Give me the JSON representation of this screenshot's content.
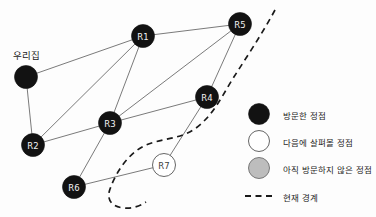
{
  "diagram": {
    "home_label": "우리집",
    "nodes": [
      {
        "id": "home",
        "label": "우리집",
        "state": "visited",
        "x": 26,
        "y": 77,
        "r": 11.5
      },
      {
        "id": "R1",
        "label": "R1",
        "state": "visited",
        "x": 143,
        "y": 36,
        "r": 11.5
      },
      {
        "id": "R2",
        "label": "R2",
        "state": "visited",
        "x": 33,
        "y": 145,
        "r": 11.5
      },
      {
        "id": "R3",
        "label": "R3",
        "state": "visited",
        "x": 110,
        "y": 123,
        "r": 11.5
      },
      {
        "id": "R4",
        "label": "R4",
        "state": "visited",
        "x": 207,
        "y": 97,
        "r": 11.5
      },
      {
        "id": "R5",
        "label": "R5",
        "state": "visited",
        "x": 240,
        "y": 24,
        "r": 11.5
      },
      {
        "id": "R6",
        "label": "R6",
        "state": "visited",
        "x": 74,
        "y": 187,
        "r": 11.5
      },
      {
        "id": "R7",
        "label": "R7",
        "state": "frontier",
        "x": 164,
        "y": 165,
        "r": 11.5
      }
    ],
    "edges": [
      {
        "from": "home",
        "to": "R1"
      },
      {
        "from": "home",
        "to": "R2"
      },
      {
        "from": "R2",
        "to": "R1"
      },
      {
        "from": "R2",
        "to": "R3"
      },
      {
        "from": "R3",
        "to": "R1"
      },
      {
        "from": "R3",
        "to": "R4"
      },
      {
        "from": "R3",
        "to": "R5"
      },
      {
        "from": "R3",
        "to": "R6"
      },
      {
        "from": "R1",
        "to": "R5"
      },
      {
        "from": "R4",
        "to": "R5"
      },
      {
        "from": "R4",
        "to": "R7"
      },
      {
        "from": "R6",
        "to": "R7"
      }
    ],
    "frontier_curve": "M 275 10 C 262 34, 246 58, 232 80 C 220 100, 212 116, 196 128 C 180 140, 160 138, 144 146 C 128 154, 116 172, 110 189 C 106 200, 112 207, 124 208 C 132 209, 140 206, 146 202"
  },
  "legend": {
    "items": [
      {
        "marker": "filled-circle",
        "state": "visited",
        "label": "방문한 정점",
        "color": "#121212"
      },
      {
        "marker": "open-circle",
        "state": "frontier",
        "label": "다음에 살펴볼 정점",
        "color": "#ffffff"
      },
      {
        "marker": "gray-circle",
        "state": "unvisited",
        "label": "아직 방문하지 않은 정점",
        "color": "#bdbdbd"
      },
      {
        "marker": "dashed-line",
        "state": "boundary",
        "label": "현재 경계",
        "color": "#1a1a1a"
      }
    ]
  }
}
